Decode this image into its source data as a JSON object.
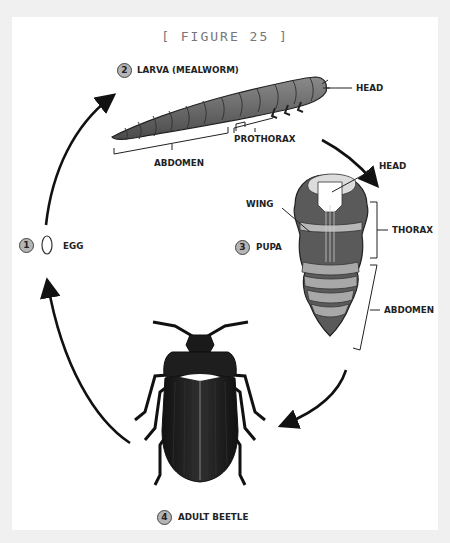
{
  "figure": {
    "title": "[ FIGURE 25 ]"
  },
  "stages": [
    {
      "number": "1",
      "label": "EGG"
    },
    {
      "number": "2",
      "label": "LARVA (MEALWORM)",
      "parts": [
        "HEAD",
        "PROTHORAX",
        "ABDOMEN"
      ]
    },
    {
      "number": "3",
      "label": "PUPA",
      "parts": [
        "HEAD",
        "WING",
        "THORAX",
        "ABDOMEN"
      ]
    },
    {
      "number": "4",
      "label": "ADULT BEETLE"
    }
  ],
  "colors": {
    "frame": "#f0f0f0",
    "panel": "#ffffff",
    "ink": "#222222",
    "larva": "#6e6e6e",
    "pupa_dark": "#5a5a5a",
    "pupa_light": "#b8b8b8",
    "beetle": "#1e1e1e",
    "stage_circle": "#b5b5b5"
  }
}
